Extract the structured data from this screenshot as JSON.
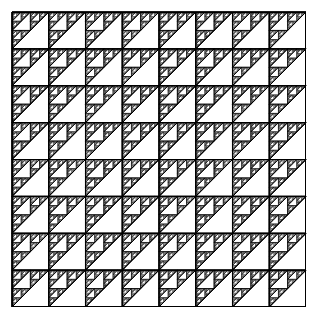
{
  "figure": {
    "kind": "fractal-tiling",
    "canvas": {
      "width_px": 317,
      "height_px": 321,
      "background_color": "#ffffff"
    },
    "pattern_area": {
      "x_px": 12,
      "y_px": 12,
      "width_px": 294,
      "height_px": 295,
      "outer_border": true,
      "outer_border_color": "#000000",
      "outer_border_width_px": 1
    },
    "tiling": {
      "columns": 8,
      "rows": 8,
      "cell_width_px": 36.75,
      "cell_height_px": 36.875,
      "orientation": "upper-left right triangle with hypotenuse from top-right to bottom-left"
    },
    "recursion": {
      "depth": 4,
      "rule": "each right triangle splits into 4 half-scale right triangles; the middle hypotenuse tile is rotated and the three corner tiles recurse",
      "min_feature_px": 2.3
    },
    "stroke": {
      "color": "#000000",
      "width_px": 0.55,
      "hypotenuse_width_px": 0.9,
      "major_grid_width_px": 1.1,
      "antialias_gray": "#7a7a7a"
    },
    "colors": {
      "ink": "#000000",
      "paper": "#ffffff",
      "mid_gray": "#808080",
      "light_gray": "#c8c8c8"
    },
    "labels": {
      "caption": "",
      "axis_x": "",
      "axis_y": ""
    }
  },
  "chart_data": {
    "type": "heatmap",
    "xlabel": "",
    "ylabel": "",
    "categories": [],
    "values": [],
    "grid": true,
    "legend_position": "none"
  }
}
